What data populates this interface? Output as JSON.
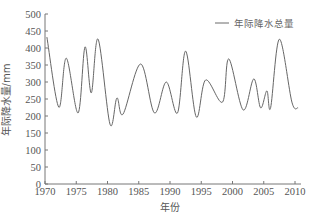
{
  "chart_data": {
    "type": "line",
    "title": "",
    "xlabel": "年份",
    "ylabel": "年际降水量/mm",
    "xlim": [
      1970,
      2011
    ],
    "ylim": [
      0,
      500
    ],
    "x_ticks": [
      1970,
      1975,
      1980,
      1985,
      1990,
      1995,
      2000,
      2005,
      2010
    ],
    "y_ticks": [
      0,
      50,
      100,
      150,
      200,
      250,
      300,
      350,
      400,
      450,
      500
    ],
    "grid": false,
    "legend_position": "upper right",
    "series": [
      {
        "name": "年际降水总量",
        "color": "#666666",
        "x": [
          1970.3,
          1972.2,
          1973.4,
          1975.3,
          1976.4,
          1977.4,
          1978.5,
          1980.4,
          1981.5,
          1982.5,
          1985.3,
          1987.5,
          1989.4,
          1991.2,
          1992.5,
          1994.2,
          1995.7,
          1998.4,
          1999.4,
          2001.7,
          2003.4,
          2004.5,
          2005.5,
          2006.1,
          2007.5,
          2009.5,
          2010.5
        ],
        "values": [
          432,
          226,
          370,
          209,
          403,
          268,
          426,
          176,
          253,
          206,
          353,
          209,
          300,
          209,
          391,
          197,
          306,
          241,
          368,
          218,
          309,
          224,
          274,
          224,
          426,
          241,
          224
        ]
      }
    ]
  },
  "legend": {
    "label": "年际降水总量"
  },
  "axes": {
    "xlabel": "年份",
    "ylabel": "年际降水量/mm"
  }
}
